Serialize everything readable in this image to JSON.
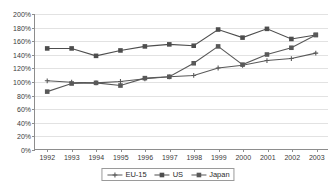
{
  "chart_data": {
    "type": "line",
    "title": "",
    "xlabel": "",
    "ylabel": "",
    "categories": [
      "1992",
      "1993",
      "1994",
      "1995",
      "1996",
      "1997",
      "1998",
      "1999",
      "2000",
      "2001",
      "2002",
      "2003"
    ],
    "series": [
      {
        "name": "EU-15",
        "marker": "cross",
        "color": "#595959",
        "values": [
          101,
          99,
          98,
          100,
          104,
          107,
          109,
          120,
          124,
          131,
          134,
          142
        ]
      },
      {
        "name": "US",
        "marker": "square",
        "color": "#4d4d4d",
        "values": [
          149,
          149,
          138,
          146,
          152,
          155,
          153,
          177,
          165,
          178,
          163,
          169
        ]
      },
      {
        "name": "Japan",
        "marker": "square",
        "color": "#595959",
        "values": [
          85,
          97,
          98,
          94,
          105,
          107,
          127,
          152,
          125,
          140,
          150,
          169
        ]
      }
    ],
    "ylim": [
      0,
      200
    ],
    "ytick_step": 20,
    "ytick_labels": [
      "0%",
      "20%",
      "40%",
      "60%",
      "80%",
      "100%",
      "120%",
      "140%",
      "160%",
      "180%",
      "200%"
    ],
    "ytick_values": [
      0,
      20,
      40,
      60,
      80,
      100,
      120,
      140,
      160,
      180,
      200
    ],
    "grid": true,
    "grid_axis": "y",
    "legend_position": "bottom",
    "legend_entries": [
      "EU-15",
      "US",
      "Japan"
    ],
    "axis_color": "#8d8d8d",
    "grid_color": "#e2e2e2",
    "background": "#ffffff"
  }
}
